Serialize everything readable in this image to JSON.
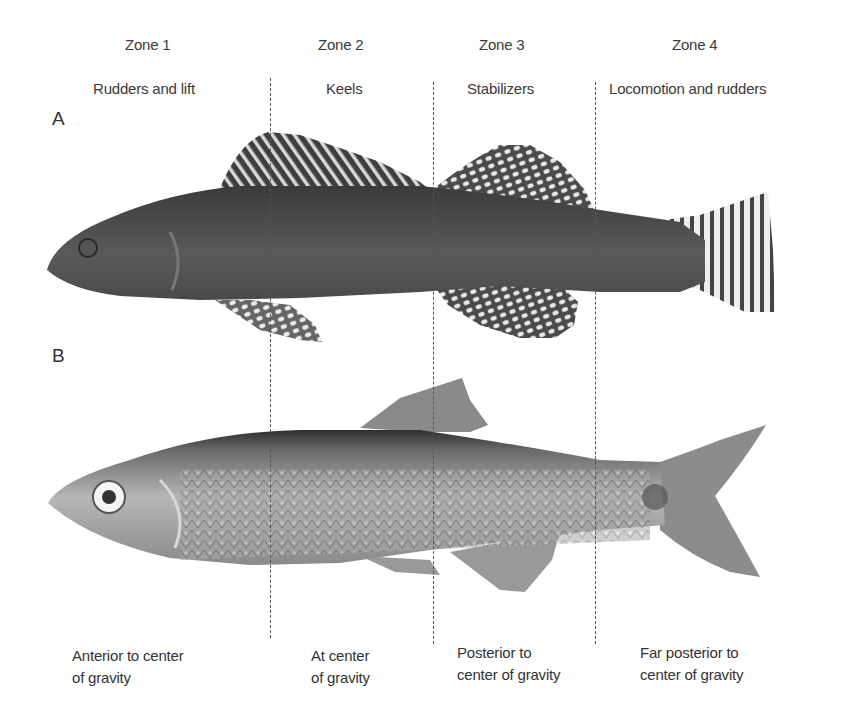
{
  "figure": {
    "zones": [
      {
        "title": "Zone 1",
        "role": "Rudders and lift",
        "position": "Anterior to center of gravity",
        "position_lines": [
          "Anterior to center",
          "of gravity"
        ]
      },
      {
        "title": "Zone 2",
        "role": "Keels",
        "position": "At center of gravity",
        "position_lines": [
          "At center",
          "of gravity"
        ]
      },
      {
        "title": "Zone 3",
        "role": "Stabilizers",
        "position": "Posterior to center of gravity",
        "position_lines": [
          "Posterior to",
          "center of gravity"
        ]
      },
      {
        "title": "Zone 4",
        "role": "Locomotion and rudders",
        "position": "Far posterior to center of gravity",
        "position_lines": [
          "Far posterior to",
          "center of gravity"
        ]
      }
    ],
    "panels": [
      {
        "label": "A",
        "subject": "darter-like fish with checkered fins"
      },
      {
        "label": "B",
        "subject": "minnow-like fish with silvery scales"
      }
    ]
  }
}
